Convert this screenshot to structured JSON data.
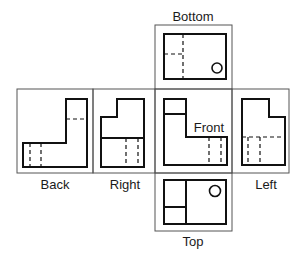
{
  "diagram": {
    "views": [
      {
        "name": "Bottom",
        "label": "Bottom"
      },
      {
        "name": "Back",
        "label": "Back"
      },
      {
        "name": "Right",
        "label": "Right"
      },
      {
        "name": "Front",
        "label": "Front"
      },
      {
        "name": "Left",
        "label": "Left"
      },
      {
        "name": "Top",
        "label": "Top"
      }
    ]
  }
}
